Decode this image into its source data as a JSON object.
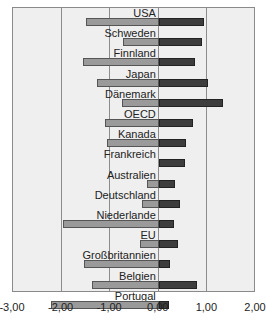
{
  "chart_data": {
    "type": "bar",
    "orientation": "horizontal",
    "title": "",
    "xlabel": "",
    "ylabel": "",
    "xlim": [
      -3,
      2
    ],
    "x_ticks": [
      "-3,00",
      "-2,00",
      "-1,00",
      "0,00",
      "1,00",
      "2,00"
    ],
    "x_tick_values": [
      -3,
      -2,
      -1,
      0,
      1,
      2
    ],
    "grid": "vertical",
    "legend": null,
    "categories": [
      "USA",
      "Schweden",
      "Finnland",
      "Japan",
      "Dänemark",
      "OECD",
      "Kanada",
      "Frankreich",
      "Australien",
      "Deutschland",
      "Niederlande",
      "EU",
      "Großbritannien",
      "Belgien",
      "Portugal"
    ],
    "series": [
      {
        "name": "series_1",
        "color": "#9a9a9a",
        "values": [
          -1.5,
          -0.74,
          -1.56,
          -1.28,
          -0.76,
          -1.11,
          -1.07,
          0.0,
          -0.25,
          -0.35,
          -1.98,
          -0.39,
          -1.54,
          -1.38,
          -2.22
        ]
      },
      {
        "name": "series_2",
        "color": "#3d3d3d",
        "values": [
          0.93,
          0.88,
          0.74,
          1.01,
          1.32,
          0.71,
          0.56,
          0.54,
          0.33,
          0.43,
          0.31,
          0.39,
          0.23,
          0.78,
          0.22
        ]
      }
    ]
  },
  "colors": {
    "plot_background": "#efefef",
    "gridline": "#8c8c8c",
    "series_1": "#9a9a9a",
    "series_2": "#3d3d3d"
  }
}
